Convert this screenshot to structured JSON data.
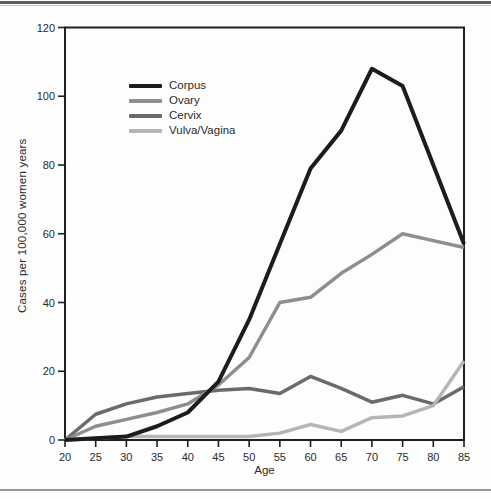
{
  "figure": {
    "xlabel": "Age",
    "ylabel": "Cases per 100,000 women years"
  },
  "chart_data": {
    "type": "line",
    "title": "",
    "xlabel": "Age",
    "ylabel": "Cases per 100,000 women years",
    "xlim": [
      20,
      85
    ],
    "ylim": [
      0,
      120
    ],
    "grid": false,
    "legend_position": "upper-left-inside",
    "x": [
      20,
      25,
      30,
      35,
      40,
      45,
      50,
      55,
      60,
      65,
      70,
      75,
      80,
      85
    ],
    "x_ticks": [
      "20",
      "25",
      "30",
      "35",
      "40",
      "45",
      "50",
      "55",
      "60",
      "65",
      "70",
      "75",
      "80",
      "85"
    ],
    "y_ticks": [
      "0",
      "20",
      "40",
      "60",
      "80",
      "100",
      "120"
    ],
    "series": [
      {
        "name": "Corpus",
        "color": "#1c1c1c",
        "width": 4,
        "values": [
          0,
          0.5,
          1,
          4,
          8,
          17,
          35,
          57,
          79,
          90,
          108,
          103,
          80,
          57
        ]
      },
      {
        "name": "Ovary",
        "color": "#8e8e8e",
        "width": 3.5,
        "values": [
          0,
          4,
          6,
          8,
          10.5,
          16,
          24,
          40,
          41.5,
          48.5,
          54,
          60,
          58,
          56
        ]
      },
      {
        "name": "Cervix",
        "color": "#6a6a6a",
        "width": 3.5,
        "values": [
          0,
          7.5,
          10.5,
          12.5,
          13.5,
          14.5,
          15,
          13.5,
          18.5,
          15,
          11,
          13,
          10.5,
          15.5
        ]
      },
      {
        "name": "Vulva/Vagina",
        "color": "#b5b5b5",
        "width": 3.5,
        "values": [
          0,
          0.5,
          1,
          1,
          1,
          1,
          1,
          2,
          4.5,
          2.5,
          6.5,
          7,
          10,
          23
        ]
      }
    ]
  }
}
